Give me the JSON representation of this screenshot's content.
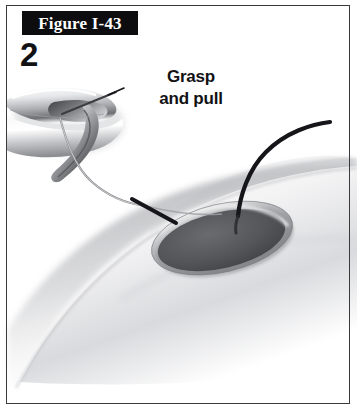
{
  "figure": {
    "label": "Figure I-43",
    "step_number": "2",
    "caption_line_1": "Grasp",
    "caption_line_2": "and pull",
    "border_color": "#3a3a3c",
    "label_box_color": "#0d0d0f",
    "label_text_color": "#ffffff",
    "text_color": "#121214",
    "background_color": "#ffffff"
  },
  "illustration": {
    "type": "medical-procedure-line-art",
    "description": "Grayscale surgical illustration: a curved metallic instrument at upper left grasps a suture thread which runs to a dark oval wound opening on a shaded curved body surface; a second heavy black suture strand rises from the wound toward the upper right.",
    "elements": [
      {
        "name": "surgical-instrument",
        "label": "metallic hooked instrument",
        "fill_light": "#fdfdfd",
        "fill_mid": "#b9babd",
        "fill_dark": "#4a4a4e"
      },
      {
        "name": "body-surface",
        "label": "shaded anatomical surface",
        "fill_light": "#ffffff",
        "fill_shadow": "#c9cacd"
      },
      {
        "name": "wound-opening",
        "label": "dark oval tissue opening",
        "fill": "#55565a",
        "rim": "#9d9ea2"
      },
      {
        "name": "suture-thread-instrument",
        "label": "thin light suture held by instrument",
        "stroke": "#8a8b8f"
      },
      {
        "name": "suture-thread-upper",
        "label": "heavy black suture strand",
        "stroke": "#15151a"
      },
      {
        "name": "suture-thread-segment",
        "label": "short black thread segment at wound edge",
        "stroke": "#15151a"
      }
    ]
  }
}
